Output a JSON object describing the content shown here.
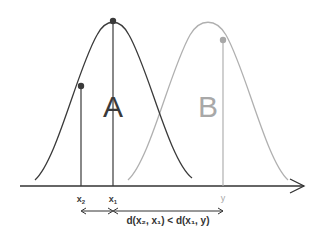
{
  "diagram": {
    "distributions": [
      {
        "label": "A",
        "color": "#3a3a3a",
        "mean_x": 113,
        "point_label": "x1"
      },
      {
        "label": "B",
        "color": "#a8a8a8",
        "mean_x": 208,
        "point_label": "y"
      }
    ],
    "points": [
      {
        "label": "x2",
        "sub": "2",
        "base": "x",
        "color": "#3a3a3a"
      },
      {
        "label": "x1",
        "sub": "1",
        "base": "x",
        "color": "#3a3a3a"
      },
      {
        "label": "y",
        "color": "#a8a8a8"
      }
    ],
    "labels": {
      "a": "A",
      "b": "B",
      "x2_base": "x",
      "x2_sub": "2",
      "x1_base": "x",
      "x1_sub": "1",
      "y": "y",
      "inequality": "d(x₂, x₁) < d(x₁, y)"
    },
    "colors": {
      "dark": "#3a3a3a",
      "light": "#a8a8a8",
      "axis": "#333333"
    }
  }
}
